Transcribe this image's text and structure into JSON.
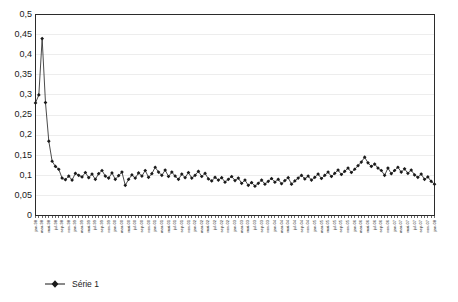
{
  "chart_data": {
    "type": "line",
    "title": "",
    "xlabel": "",
    "ylabel": "",
    "ylim": [
      0,
      0.5
    ],
    "ytick_step": 0.05,
    "grid": true,
    "decimal_separator": ",",
    "legend_position": "bottom-left",
    "marker": "diamond",
    "line_color": "#2b2b2b",
    "marker_color": "#1a1a1a",
    "gridline_color": "#e9e9e9",
    "axis_color": "#2b2b2b",
    "ytick_labels": [
      "0,5",
      "0,45",
      "0,4",
      "0,35",
      "0,3",
      "0,25",
      "0,2",
      "0,15",
      "0,1",
      "0,05",
      "0"
    ],
    "ytick_values": [
      0.5,
      0.45,
      0.4,
      0.35,
      0.3,
      0.25,
      0.2,
      0.15,
      0.1,
      0.05,
      0
    ],
    "xtick_label_interval": 2,
    "series": [
      {
        "name": "Série 1",
        "categories": [
          "jan-98",
          "fév-98",
          "mar-98",
          "avr-98",
          "mai-98",
          "jui-98",
          "jul-98",
          "aoû-98",
          "sep-98",
          "oct-98",
          "nov-98",
          "déc-98",
          "jan-99",
          "fév-99",
          "mar-99",
          "avr-99",
          "mai-99",
          "jui-99",
          "jul-99",
          "aoû-99",
          "sep-99",
          "oct-99",
          "nov-99",
          "déc-99",
          "jan-00",
          "fév-00",
          "mar-00",
          "avr-00",
          "mai-00",
          "jui-00",
          "jul-00",
          "aoû-00",
          "sep-00",
          "oct-00",
          "nov-00",
          "déc-00",
          "jan-01",
          "fév-01",
          "mar-01",
          "avr-01",
          "mai-01",
          "jui-01",
          "jul-01",
          "aoû-01",
          "sep-01",
          "oct-01",
          "nov-01",
          "déc-01",
          "jan-02",
          "fév-02",
          "mar-02",
          "avr-02",
          "mai-02",
          "jui-02",
          "jul-02",
          "aoû-02",
          "sep-02",
          "oct-02",
          "nov-02",
          "déc-02",
          "jan-03",
          "fév-03",
          "mar-03",
          "avr-03",
          "mai-03",
          "jui-03",
          "jul-03",
          "aoû-03",
          "sep-03",
          "oct-03",
          "nov-03",
          "déc-03",
          "jan-04",
          "fév-04",
          "mar-04",
          "avr-04",
          "mai-04",
          "jui-04",
          "jul-04",
          "aoû-04",
          "sep-04",
          "oct-04",
          "nov-04",
          "déc-04",
          "jan-05",
          "fév-05",
          "mar-05",
          "avr-05",
          "mai-05",
          "jui-05",
          "jul-05",
          "aoû-05",
          "sep-05",
          "oct-05",
          "nov-05",
          "déc-05",
          "jan-06",
          "fév-06",
          "mar-06",
          "avr-06",
          "mai-06",
          "jui-06",
          "jul-06",
          "aoû-06",
          "sep-06",
          "oct-06",
          "nov-06",
          "déc-06",
          "jan-07",
          "fév-07",
          "mar-07",
          "avr-07",
          "mai-07",
          "jui-07",
          "jul-07",
          "aoû-07",
          "sep-07",
          "oct-07",
          "nov-07",
          "déc-07",
          "jan-08"
        ],
        "values": [
          0.28,
          0.3,
          0.44,
          0.281,
          0.185,
          0.135,
          0.122,
          0.115,
          0.093,
          0.089,
          0.098,
          0.088,
          0.105,
          0.1,
          0.096,
          0.107,
          0.094,
          0.103,
          0.09,
          0.104,
          0.112,
          0.098,
          0.093,
          0.106,
          0.09,
          0.099,
          0.108,
          0.075,
          0.09,
          0.101,
          0.093,
          0.106,
          0.098,
          0.112,
          0.095,
          0.104,
          0.12,
          0.108,
          0.1,
          0.113,
          0.097,
          0.108,
          0.098,
          0.09,
          0.103,
          0.094,
          0.107,
          0.093,
          0.1,
          0.11,
          0.097,
          0.105,
          0.091,
          0.086,
          0.095,
          0.088,
          0.094,
          0.083,
          0.09,
          0.097,
          0.087,
          0.093,
          0.08,
          0.088,
          0.075,
          0.082,
          0.073,
          0.08,
          0.088,
          0.078,
          0.085,
          0.092,
          0.083,
          0.09,
          0.079,
          0.087,
          0.094,
          0.078,
          0.086,
          0.093,
          0.1,
          0.091,
          0.098,
          0.088,
          0.095,
          0.103,
          0.092,
          0.1,
          0.108,
          0.097,
          0.105,
          0.113,
          0.102,
          0.11,
          0.118,
          0.107,
          0.115,
          0.124,
          0.133,
          0.145,
          0.131,
          0.122,
          0.128,
          0.118,
          0.112,
          0.1,
          0.118,
          0.104,
          0.112,
          0.12,
          0.108,
          0.116,
          0.105,
          0.113,
          0.101,
          0.095,
          0.103,
          0.09,
          0.096,
          0.085,
          0.078
        ]
      }
    ]
  },
  "legend": {
    "entries": [
      {
        "label": "Série 1",
        "marker": "diamond"
      }
    ]
  }
}
